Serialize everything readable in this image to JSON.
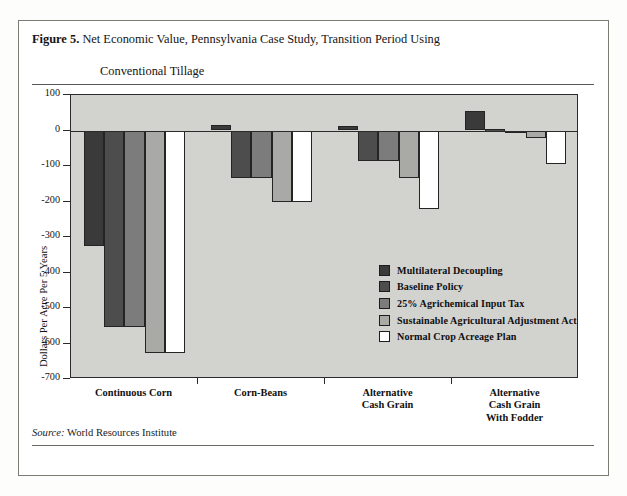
{
  "caption": {
    "figure_number": "Figure 5.",
    "line1": "Net Economic Value, Pennsylvania Case Study, Transition Period Using",
    "line2": "Conventional Tillage"
  },
  "source": {
    "label": "Source:",
    "text": " World Resources Institute"
  },
  "chart_data": {
    "type": "bar",
    "title": "Net Economic Value, Pennsylvania Case Study, Transition Period Using Conventional Tillage",
    "xlabel": "",
    "ylabel": "Dollars Per Acre Per 5 Years",
    "ylim": [
      -700,
      100
    ],
    "yticks": [
      100,
      0,
      -100,
      -200,
      -300,
      -400,
      -500,
      -600,
      -700
    ],
    "ytick_labels": [
      "100",
      "0",
      "-100",
      "-200",
      "-300",
      "-400",
      "-500",
      "-600",
      "-700"
    ],
    "grid": false,
    "legend_position": "inside-right",
    "categories": [
      "Continuous Corn",
      "Corn-Beans",
      "Alternative Cash Grain",
      "Alternative Cash Grain With Fodder"
    ],
    "category_lines": [
      [
        "Continuous Corn"
      ],
      [
        "Corn-Beans"
      ],
      [
        "Alternative",
        "Cash Grain"
      ],
      [
        "Alternative",
        "Cash Grain",
        "With Fodder"
      ]
    ],
    "series": [
      {
        "name": "Multilateral Decoupling",
        "color": "#3a3a3a",
        "values": [
          -325,
          15,
          12,
          55
        ]
      },
      {
        "name": "Baseline Policy",
        "color": "#4d4d4d",
        "values": [
          -553,
          -135,
          -85,
          3
        ]
      },
      {
        "name": "25%  Agrichemical Input Tax",
        "color": "#7c7c7c",
        "values": [
          -553,
          -135,
          -85,
          -5
        ]
      },
      {
        "name": "Sustainable Agricultural Adjustment Act",
        "color": "#a9a9a6",
        "values": [
          -627,
          -200,
          -133,
          -22
        ]
      },
      {
        "name": "Normal Crop Acreage Plan",
        "color": "#ffffff",
        "values": [
          -627,
          -200,
          -220,
          -95
        ]
      }
    ]
  }
}
